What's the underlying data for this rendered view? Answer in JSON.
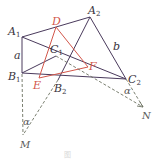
{
  "diagram": {
    "colors": {
      "triangle": "#4a3a5c",
      "inner_triangle": "#d2564a",
      "dashed": "#6b7060",
      "label": "#3a3540",
      "label_red": "#d2564a"
    },
    "points": {
      "A1": {
        "label": "A",
        "sub": "1",
        "x": 22,
        "y": 37
      },
      "B1": {
        "label": "B",
        "sub": "1",
        "x": 22,
        "y": 73
      },
      "C1": {
        "label": "C",
        "sub": "1",
        "x": 56,
        "y": 56
      },
      "A2": {
        "label": "A",
        "sub": "2",
        "x": 90,
        "y": 17
      },
      "B2": {
        "label": "B",
        "sub": "2",
        "x": 58,
        "y": 80
      },
      "C2": {
        "label": "C",
        "sub": "2",
        "x": 126,
        "y": 79
      },
      "D": {
        "label": "D",
        "x": 56,
        "y": 27
      },
      "E": {
        "label": "E",
        "x": 39,
        "y": 78
      },
      "F": {
        "label": "F",
        "x": 88,
        "y": 67
      },
      "M": {
        "label": "M",
        "x": 23,
        "y": 135
      },
      "N": {
        "label": "N",
        "x": 143,
        "y": 107
      }
    },
    "side_labels": {
      "a": "a",
      "b": "b"
    },
    "angle_labels": {
      "alpha_M": "α",
      "alpha_N": "α"
    },
    "caption": "图"
  }
}
